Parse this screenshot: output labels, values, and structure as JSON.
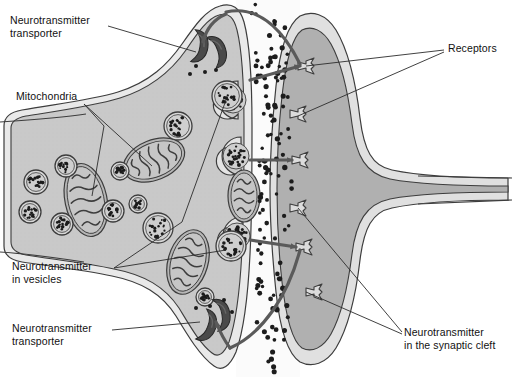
{
  "figure": {
    "background": "#ffffff"
  },
  "labels": {
    "transporter_top": "Neurotransmitter\ntransporter",
    "mitochondria": "Mitochondria",
    "vesicles": "Neurotransmitter\nin vesicles",
    "transporter_bottom": "Neurotransmitter\ntransporter",
    "receptors": "Receptors",
    "cleft": "Neurotransmitter\nin the synaptic cleft"
  },
  "colors": {
    "outline": "#3d3d3d",
    "presyn_cytoplasm": "#c9c9c9",
    "presyn_membrane": "#e4e4e4",
    "postsyn_cytoplasm": "#b0b0b0",
    "postsyn_membrane": "#e0e0e0",
    "cleft": "#fbfbfb",
    "vesicle_fill": "#d8d8d8",
    "mito_fill": "#b6b6b6",
    "transporter_fill": "#4a4a4a",
    "neurotransmitter_dot": "#1c1c1c",
    "arrow": "#5a5a5a",
    "receptor_fill": "#dcdcdc",
    "leader_line": "#2b2b2b",
    "text": "#111111"
  },
  "structures": {
    "presynaptic_terminal": {
      "name": "presynaptic axon terminal",
      "mitochondria_count": 4,
      "vesicle_count": 12,
      "docked_vesicle_count": 3,
      "transporter_pairs": 2
    },
    "postsynaptic_cell": {
      "name": "postsynaptic dendrite",
      "receptor_count": 6
    },
    "synaptic_cleft": {
      "name": "synaptic cleft",
      "neurotransmitter_dot_count": 120,
      "release_arrows": 3,
      "reuptake_arrows": 2
    }
  },
  "geometry": {
    "presyn_outer": "M 4,126 C 4,118 10,112 22,110 C 56,104 92,100 118,92 C 150,82 168,64 182,44 C 196,24 206,10 220,6 C 232,2 240,8 244,22 C 250,44 252,80 252,126 C 252,172 252,218 250,254 C 248,296 244,330 236,352 C 230,366 222,372 214,366 C 200,356 188,336 176,316 C 162,294 142,282 112,276 C 84,270 48,266 22,262 C 10,260 4,254 4,246 Z",
    "presyn_inner": "M 11,128 C 11,122 16,118 26,116 C 58,111 94,106 120,98 C 152,88 172,70 186,50 C 198,32 208,18 219,15 C 229,12 234,18 237,30 C 242,50 244,82 244,126 C 244,170 244,216 242,250 C 240,290 236,322 229,342 C 224,354 218,358 212,353 C 200,344 190,326 179,308 C 165,287 145,275 114,269 C 86,263 50,259 26,255 C 16,253 11,248 11,242 Z",
    "postsyn_outer": "M 300,16 C 312,10 326,14 336,30 C 348,50 356,84 360,118 C 364,150 372,166 392,170 C 420,176 460,178 508,178 L 508,200 C 460,200 420,202 392,208 C 372,212 364,228 360,260 C 356,294 348,328 336,348 C 326,364 312,368 300,362 C 288,354 280,330 276,292 C 272,254 270,216 270,189 C 270,162 272,124 276,86 C 280,48 288,24 300,16 Z",
    "postsyn_inner": "M 302,30 C 312,25 323,30 331,44 C 341,62 348,92 352,124 C 356,156 366,174 390,179 C 416,184 460,186 508,186 L 508,192 C 460,192 416,194 390,199 C 366,204 356,222 352,254 C 348,286 341,316 331,334 C 323,348 312,353 302,348 C 292,341 286,318 282,282 C 278,246 277,214 277,189 C 277,164 278,132 282,96 C 286,60 292,37 302,30 Z"
  },
  "mitochondria": [
    {
      "cx": 86,
      "cy": 200,
      "rx": 21,
      "ry": 37,
      "rot": -12
    },
    {
      "cx": 154,
      "cy": 160,
      "rx": 32,
      "ry": 20,
      "rot": -22
    },
    {
      "cx": 188,
      "cy": 262,
      "rx": 20,
      "ry": 33,
      "rot": 16
    },
    {
      "cx": 244,
      "cy": 196,
      "rx": 16,
      "ry": 26,
      "rot": 0
    }
  ],
  "vesicles": [
    {
      "cx": 36,
      "cy": 182,
      "r": 12
    },
    {
      "cx": 66,
      "cy": 166,
      "r": 11
    },
    {
      "cx": 30,
      "cy": 212,
      "r": 11
    },
    {
      "cx": 62,
      "cy": 224,
      "r": 11
    },
    {
      "cx": 120,
      "cy": 171,
      "r": 9
    },
    {
      "cx": 113,
      "cy": 211,
      "r": 11
    },
    {
      "cx": 138,
      "cy": 204,
      "r": 9
    },
    {
      "cx": 178,
      "cy": 126,
      "r": 14
    },
    {
      "cx": 227,
      "cy": 96,
      "r": 15
    },
    {
      "cx": 158,
      "cy": 228,
      "r": 15
    },
    {
      "cx": 205,
      "cy": 297,
      "r": 9
    },
    {
      "cx": 231,
      "cy": 246,
      "r": 15
    }
  ],
  "docked_vesicles": [
    {
      "cx": 234,
      "cy": 100,
      "r": 15
    },
    {
      "cx": 237,
      "cy": 156,
      "r": 15
    },
    {
      "cx": 238,
      "cy": 236,
      "r": 15
    }
  ],
  "transporters": [
    {
      "cx": 196,
      "cy": 46,
      "rot": 8
    },
    {
      "cx": 214,
      "cy": 52,
      "rot": -18
    },
    {
      "cx": 204,
      "cy": 325,
      "rot": 20
    },
    {
      "cx": 218,
      "cy": 315,
      "rot": -10
    }
  ],
  "receptors": [
    {
      "x": 302,
      "y": 66
    },
    {
      "x": 294,
      "y": 114
    },
    {
      "x": 296,
      "y": 160
    },
    {
      "x": 294,
      "y": 208
    },
    {
      "x": 300,
      "y": 247
    },
    {
      "x": 310,
      "y": 292
    }
  ],
  "label_positions": {
    "transporter_top": {
      "left": 10,
      "top": 14
    },
    "mitochondria": {
      "left": 16,
      "top": 90
    },
    "vesicles": {
      "left": 12,
      "top": 260
    },
    "transporter_bottom": {
      "left": 12,
      "top": 322
    },
    "receptors": {
      "left": 448,
      "top": 42
    },
    "cleft": {
      "left": 404,
      "top": 326
    }
  }
}
